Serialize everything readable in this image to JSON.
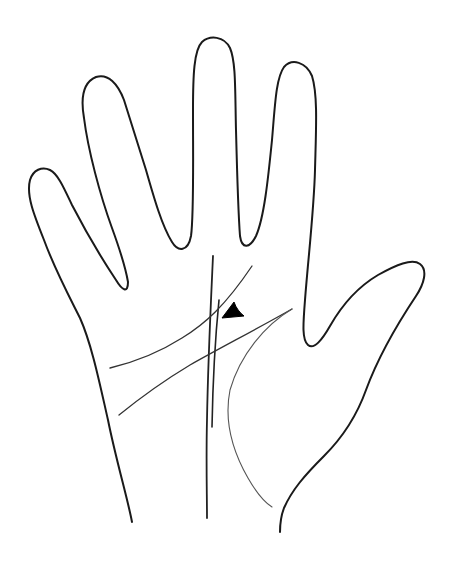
{
  "diagram": {
    "title": "Palm line drawing with triangle marker",
    "colors": {
      "background": "#ffffff",
      "outline": "#1a1a1a",
      "palm_lines": "#333333",
      "marker": "#000000"
    },
    "elements": [
      {
        "id": "hand-outline",
        "label": "Hand outline"
      },
      {
        "id": "fate-line",
        "label": "Long vertical line"
      },
      {
        "id": "secondary-vertical-line",
        "label": "Short vertical line"
      },
      {
        "id": "heart-line",
        "label": "Upper transverse line"
      },
      {
        "id": "head-line",
        "label": "Lower transverse line"
      },
      {
        "id": "life-line",
        "label": "Curved line around thumb base"
      },
      {
        "id": "triangle-marker",
        "label": "Triangle marker"
      }
    ]
  }
}
